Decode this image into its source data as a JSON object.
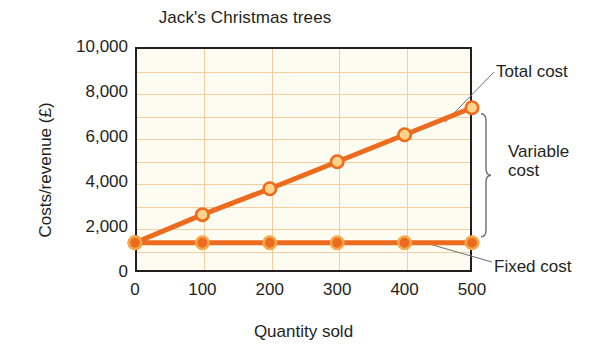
{
  "chart_data": {
    "type": "line",
    "title": "Jack's Christmas trees",
    "xlabel": "Quantity sold",
    "ylabel": "Costs/revenue (£)",
    "xlim": [
      0,
      500
    ],
    "ylim": [
      0,
      10000
    ],
    "xticks": [
      "0",
      "100",
      "200",
      "300",
      "400",
      "500"
    ],
    "xtick_values": [
      0,
      100,
      200,
      300,
      400,
      500
    ],
    "yticks": [
      "0",
      "2,000",
      "4,000",
      "6,000",
      "8,000",
      "10,000"
    ],
    "ytick_values": [
      0,
      2000,
      4000,
      6000,
      8000,
      10000
    ],
    "grid": "both-axes-minor-1000-and-100",
    "y_gridline_values": [
      1000,
      2000,
      3000,
      4000,
      5000,
      6000,
      7000,
      8000,
      9000
    ],
    "x_gridline_values": [
      100,
      200,
      300,
      400
    ],
    "legend": "none-inline-annotations",
    "x": [
      0,
      100,
      200,
      300,
      400,
      500
    ],
    "series": [
      {
        "name": "Total cost",
        "values": [
          1300,
          2550,
          3700,
          4900,
          6100,
          7300
        ],
        "color": "#ED6B1F",
        "marker_fill": "#FBD38A",
        "marker_edge": "#ED6B1F"
      },
      {
        "name": "Fixed cost",
        "values": [
          1300,
          1300,
          1300,
          1300,
          1300,
          1300
        ],
        "color": "#ED6B1F",
        "marker_fill": "#ED6B1F",
        "marker_edge": "#F7A94A"
      }
    ],
    "annotations": [
      {
        "id": "total-cost",
        "text": "Total cost",
        "target_point": [
          460,
          6650
        ]
      },
      {
        "id": "variable-cost",
        "text": "Variable cost",
        "brace": true,
        "span_values": [
          1300,
          7300
        ]
      },
      {
        "id": "fixed-cost",
        "text": "Fixed cost",
        "target_point": [
          430,
          1300
        ]
      }
    ]
  },
  "annotations": {
    "total_cost": "Total cost",
    "variable_cost": "Variable cost",
    "fixed_cost": "Fixed cost"
  },
  "colors": {
    "line": "#ED6B1F",
    "marker_light": "#FBD38A",
    "grid": "#F2CFA0",
    "plot_background": "#FEFBF1",
    "axis": "#231F20",
    "leader_line": "#6D6E71"
  }
}
